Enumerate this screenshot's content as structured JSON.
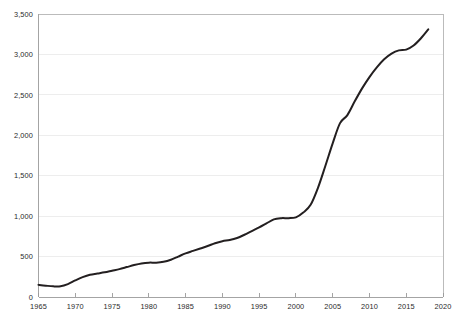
{
  "chart_data": {
    "type": "line",
    "title": "",
    "subtitle": "",
    "xlabel": "",
    "ylabel": "",
    "xlim": [
      1965,
      2020
    ],
    "ylim": [
      0,
      3500
    ],
    "grid": "horizontal",
    "legend": "none",
    "x_tick_labels": [
      "1965",
      "1970",
      "1975",
      "1980",
      "1985",
      "1990",
      "1995",
      "2000",
      "2005",
      "2010",
      "2015",
      "2020"
    ],
    "x_tick_values": [
      1965,
      1970,
      1975,
      1980,
      1985,
      1990,
      1995,
      2000,
      2005,
      2010,
      2015,
      2020
    ],
    "y_tick_labels": [
      "0",
      "500",
      "1,000",
      "1,500",
      "2,000",
      "2,500",
      "3,000",
      "3,500"
    ],
    "y_tick_values": [
      0,
      500,
      1000,
      1500,
      2000,
      2500,
      3000,
      3500
    ],
    "series": [
      {
        "name": "series-1",
        "color": "#231f20",
        "x": [
          1965,
          1966,
          1967,
          1968,
          1969,
          1970,
          1971,
          1972,
          1973,
          1974,
          1975,
          1976,
          1977,
          1978,
          1979,
          1980,
          1981,
          1982,
          1983,
          1984,
          1985,
          1986,
          1987,
          1988,
          1989,
          1990,
          1991,
          1992,
          1993,
          1994,
          1995,
          1996,
          1997,
          1998,
          1999,
          2000,
          2001,
          2002,
          2003,
          2004,
          2005,
          2006,
          2007,
          2008,
          2009,
          2010,
          2011,
          2012,
          2013,
          2014,
          2015,
          2016,
          2017,
          2018
        ],
        "values": [
          150,
          140,
          132,
          133,
          160,
          205,
          245,
          275,
          290,
          305,
          325,
          345,
          370,
          395,
          415,
          425,
          425,
          435,
          460,
          500,
          540,
          570,
          600,
          630,
          665,
          690,
          705,
          730,
          770,
          815,
          860,
          910,
          960,
          975,
          975,
          985,
          1045,
          1140,
          1350,
          1620,
          1900,
          2150,
          2250,
          2420,
          2580,
          2720,
          2840,
          2940,
          3010,
          3050,
          3060,
          3110,
          3200,
          3310
        ]
      }
    ]
  },
  "axes": {
    "x_axis_name": "year-axis",
    "y_axis_name": "value-axis"
  }
}
